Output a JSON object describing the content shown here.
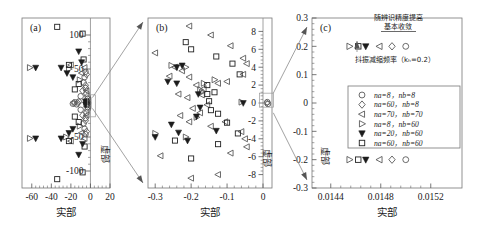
{
  "figure": {
    "axis_label_x": "实部",
    "axis_label_y": "虚部",
    "panels": [
      {
        "id": "a",
        "label": "(a)",
        "xticks": [
          "-60",
          "-40",
          "-20",
          "0",
          "20"
        ],
        "yticks": [
          "100",
          "50",
          "-50",
          "-100"
        ],
        "xlabel": "实部",
        "ylabel": "虚部"
      },
      {
        "id": "b",
        "label": "(b)",
        "xticks": [
          "-0.3",
          "-0.2",
          "-0.1",
          "0"
        ],
        "yticks": [
          "8",
          "6",
          "4",
          "2",
          "0",
          "-2",
          "-4",
          "-6",
          "-8"
        ],
        "xlabel": "实部",
        "ylabel": "虚部"
      },
      {
        "id": "c",
        "label": "(c)",
        "xticks": [
          "0.0144",
          "0.0148",
          "0.0152"
        ],
        "yticks": [
          "0.3",
          "0.2",
          "0.1",
          "0",
          "-0.1",
          "-0.2",
          "-0.3"
        ],
        "xlabel": "实部",
        "ylabel": "虚部"
      }
    ],
    "annotations": {
      "converge_line1": "随辨识精度提高",
      "converge_line2": "基本收敛",
      "damping_label": "抖振减缩频率（kₕ=0.2）"
    },
    "legend": {
      "entries": [
        {
          "marker": "circle",
          "label": "na=8，nb=8"
        },
        {
          "marker": "diamond",
          "label": "na=60，nb=8"
        },
        {
          "marker": "triangle-left",
          "label": "na=70，nb=70"
        },
        {
          "marker": "triangle-right",
          "label": "na=8，nb=60"
        },
        {
          "marker": "triangle-down-filled",
          "label": "na=20，nb=60"
        },
        {
          "marker": "square",
          "label": "na=60，nb=60"
        }
      ]
    }
  },
  "chart_data": {
    "type": "scatter",
    "title": "",
    "xlabel": "实部",
    "ylabel": "虚部",
    "grid": false,
    "legend_position": "panel-c-inset",
    "panels": [
      {
        "id": "a",
        "xlim": [
          -70,
          20
        ],
        "ylim": [
          -125,
          125
        ],
        "xticks": [
          -60,
          -40,
          -20,
          0,
          20
        ],
        "yticks": [
          100,
          50,
          -50,
          -100
        ],
        "series": [
          {
            "name": "na=8, nb=8",
            "marker": "circle",
            "points": [
              [
                -5,
                46
              ],
              [
                -6,
                38
              ],
              [
                -7,
                30
              ],
              [
                -5,
                22
              ],
              [
                -4,
                14
              ],
              [
                -3,
                6
              ],
              [
                -3,
                -6
              ],
              [
                -4,
                -14
              ],
              [
                -5,
                -22
              ],
              [
                -7,
                -30
              ],
              [
                -6,
                -38
              ],
              [
                -5,
                -46
              ],
              [
                -12,
                2
              ],
              [
                -14,
                -2
              ],
              [
                -16,
                1
              ],
              [
                -18,
                -1
              ],
              [
                -10,
                10
              ],
              [
                -10,
                -10
              ]
            ]
          },
          {
            "name": "na=60, nb=8",
            "marker": "diamond",
            "points": [
              [
                -4,
                42
              ],
              [
                -5,
                26
              ],
              [
                -3,
                10
              ],
              [
                -3,
                -10
              ],
              [
                -5,
                -26
              ],
              [
                -4,
                -42
              ],
              [
                -13,
                0
              ],
              [
                -17,
                0
              ],
              [
                -8,
                18
              ],
              [
                -8,
                -18
              ]
            ]
          },
          {
            "name": "na=70, nb=70",
            "marker": "triangle-left",
            "points": [
              [
                -6,
                52
              ],
              [
                -9,
                44
              ],
              [
                -4,
                18
              ],
              [
                -2,
                4
              ],
              [
                -2,
                -4
              ],
              [
                -4,
                -18
              ],
              [
                -9,
                -44
              ],
              [
                -6,
                -52
              ],
              [
                -20,
                56
              ],
              [
                -20,
                -56
              ]
            ]
          },
          {
            "name": "na=8, nb=60",
            "marker": "triangle-right",
            "points": [
              [
                -62,
                52
              ],
              [
                -62,
                -52
              ],
              [
                -25,
                -50
              ],
              [
                -22,
                50
              ],
              [
                -3,
                2
              ],
              [
                -3,
                -2
              ],
              [
                -11,
                34
              ],
              [
                -11,
                -34
              ]
            ]
          },
          {
            "name": "na=20, nb=60",
            "marker": "triangle-down-filled",
            "points": [
              [
                -56,
                52
              ],
              [
                -56,
                -52
              ],
              [
                -30,
                52
              ],
              [
                -30,
                -52
              ],
              [
                -24,
                44
              ],
              [
                -22,
                -44
              ],
              [
                -18,
                38
              ],
              [
                -18,
                -38
              ],
              [
                -12,
                76
              ],
              [
                -12,
                -76
              ],
              [
                -8,
                -60
              ],
              [
                -9,
                60
              ],
              [
                -5,
                2
              ],
              [
                -5,
                -2
              ]
            ]
          },
          {
            "name": "na=60, nb=60",
            "marker": "square",
            "points": [
              [
                -34,
                112
              ],
              [
                -34,
                -112
              ],
              [
                -22,
                56
              ],
              [
                -22,
                -56
              ],
              [
                -8,
                102
              ],
              [
                -8,
                -102
              ],
              [
                -6,
                -64
              ],
              [
                -7,
                64
              ],
              [
                -16,
                20
              ],
              [
                -16,
                -20
              ],
              [
                -4,
                2
              ],
              [
                -4,
                -2
              ],
              [
                -12,
                -28
              ],
              [
                -12,
                28
              ]
            ]
          }
        ]
      },
      {
        "id": "b",
        "xlim": [
          -0.32,
          0.025
        ],
        "ylim": [
          -9.5,
          9.5
        ],
        "xticks": [
          -0.3,
          -0.2,
          -0.1,
          0
        ],
        "yticks": [
          8,
          6,
          4,
          2,
          0,
          -2,
          -4,
          -6,
          -8
        ],
        "series": [
          {
            "name": "na=8, nb=8",
            "marker": "circle",
            "points": [
              [
                0.012,
                0.1
              ],
              [
                0.014,
                -0.1
              ]
            ]
          },
          {
            "name": "na=60, nb=8",
            "marker": "diamond",
            "points": [
              [
                0.01,
                0.0
              ]
            ]
          },
          {
            "name": "na=70, nb=70",
            "marker": "triangle-left",
            "points": [
              [
                -0.205,
                8.6
              ],
              [
                -0.145,
                7.6
              ],
              [
                -0.09,
                6.4
              ],
              [
                -0.3,
                5.6
              ],
              [
                -0.245,
                4.0
              ],
              [
                -0.225,
                3.6
              ],
              [
                -0.26,
                3.0
              ],
              [
                -0.205,
                2.9
              ],
              [
                -0.185,
                2.0
              ],
              [
                -0.125,
                2.2
              ],
              [
                -0.1,
                2.4
              ],
              [
                -0.055,
                3.2
              ],
              [
                -0.045,
                4.4
              ],
              [
                -0.055,
                5.0
              ],
              [
                -0.235,
                1.0
              ],
              [
                -0.21,
                0.6
              ],
              [
                -0.195,
                -0.6
              ],
              [
                -0.175,
                -1.1
              ],
              [
                -0.23,
                -1.4
              ],
              [
                -0.205,
                -2.1
              ],
              [
                -0.145,
                -2.6
              ],
              [
                -0.105,
                -2.1
              ],
              [
                -0.06,
                -3.2
              ],
              [
                -0.05,
                -4.0
              ],
              [
                -0.045,
                -4.9
              ],
              [
                -0.285,
                -5.9
              ],
              [
                -0.2,
                -8.4
              ],
              [
                -0.125,
                -8.0
              ],
              [
                -0.09,
                -5.6
              ],
              [
                -0.165,
                1.6
              ],
              [
                -0.155,
                -0.2
              ],
              [
                -0.17,
                0.9
              ]
            ]
          },
          {
            "name": "na=8, nb=60",
            "marker": "triangle-right",
            "points": [
              [
                -0.255,
                4.2
              ],
              [
                -0.215,
                4.0
              ],
              [
                -0.165,
                2.2
              ],
              [
                -0.135,
                2.6
              ],
              [
                -0.175,
                1.5
              ],
              [
                -0.185,
                -1.6
              ],
              [
                -0.215,
                -3.8
              ],
              [
                -0.3,
                -3.4
              ],
              [
                -0.06,
                0.1
              ],
              [
                -0.17,
                1.2
              ]
            ]
          },
          {
            "name": "na=20, nb=60",
            "marker": "triangle-down-filled",
            "points": [
              [
                -0.24,
                4.0
              ],
              [
                -0.225,
                4.2
              ],
              [
                -0.265,
                2.4
              ],
              [
                -0.24,
                2.2
              ],
              [
                -0.18,
                1.0
              ],
              [
                -0.175,
                -0.5
              ],
              [
                -0.185,
                -1.5
              ],
              [
                -0.255,
                -2.4
              ],
              [
                -0.235,
                -3.3
              ],
              [
                -0.21,
                -4.2
              ],
              [
                -0.3,
                -3.8
              ],
              [
                -0.055,
                0.0
              ],
              [
                -0.13,
                -3.1
              ]
            ]
          },
          {
            "name": "na=60, nb=60",
            "marker": "square",
            "points": [
              [
                -0.215,
                6.8
              ],
              [
                -0.2,
                6.0
              ],
              [
                -0.13,
                5.2
              ],
              [
                -0.085,
                4.4
              ],
              [
                -0.065,
                3.2
              ],
              [
                -0.155,
                2.0
              ],
              [
                -0.135,
                1.2
              ],
              [
                -0.15,
                0.2
              ],
              [
                -0.145,
                -0.8
              ],
              [
                -0.125,
                -1.2
              ],
              [
                -0.1,
                -2.2
              ],
              [
                -0.07,
                -3.4
              ],
              [
                -0.125,
                -4.6
              ],
              [
                -0.2,
                -6.2
              ],
              [
                -0.245,
                -4.2
              ],
              [
                -0.155,
                1.0
              ]
            ]
          }
        ]
      },
      {
        "id": "c",
        "xlim": [
          0.01425,
          0.01545
        ],
        "ylim": [
          -0.3,
          0.3
        ],
        "xticks": [
          0.0144,
          0.0148,
          0.0152
        ],
        "yticks": [
          0.3,
          0.2,
          0.1,
          0,
          -0.1,
          -0.2,
          -0.3
        ],
        "note": "damping frequency cluster, mirrored at +0.2 and -0.2",
        "series": [
          {
            "name": "na=60, nb=60",
            "marker": "square",
            "points": [
              [
                0.01462,
                0.2
              ],
              [
                0.01462,
                -0.2
              ]
            ]
          },
          {
            "name": "na=20, nb=60",
            "marker": "triangle-down-filled",
            "points": [
              [
                0.01468,
                0.2
              ],
              [
                0.01468,
                -0.2
              ]
            ]
          },
          {
            "name": "na=70, nb=70",
            "marker": "triangle-left",
            "points": [
              [
                0.01479,
                0.2
              ],
              [
                0.01479,
                -0.2
              ]
            ]
          },
          {
            "name": "na=60, nb=8",
            "marker": "diamond",
            "points": [
              [
                0.01489,
                0.2
              ],
              [
                0.01489,
                -0.2
              ]
            ]
          },
          {
            "name": "na=8, nb=8",
            "marker": "circle",
            "points": [
              [
                0.015,
                0.2
              ],
              [
                0.015,
                -0.2
              ]
            ]
          },
          {
            "name": "na=8, nb=60",
            "marker": "triangle-right",
            "points": [
              [
                0.01455,
                0.2
              ],
              [
                0.01455,
                -0.2
              ]
            ]
          }
        ]
      }
    ]
  }
}
